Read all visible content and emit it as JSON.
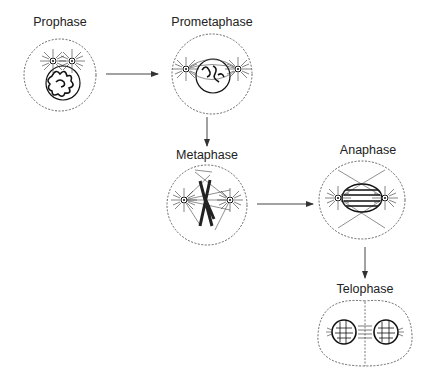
{
  "stages": [
    {
      "id": "prophase",
      "label": "Prophase"
    },
    {
      "id": "prometaphase",
      "label": "Prometaphase"
    },
    {
      "id": "metaphase",
      "label": "Metaphase"
    },
    {
      "id": "anaphase",
      "label": "Anaphase"
    },
    {
      "id": "telophase",
      "label": "Telophase"
    }
  ],
  "flow": [
    {
      "from": "prophase",
      "to": "prometaphase",
      "direction": "right"
    },
    {
      "from": "prometaphase",
      "to": "metaphase",
      "direction": "down"
    },
    {
      "from": "metaphase",
      "to": "anaphase",
      "direction": "right"
    },
    {
      "from": "anaphase",
      "to": "telophase",
      "direction": "down"
    }
  ],
  "colors": {
    "line": "#444444",
    "ink": "#111111",
    "background": "#ffffff"
  }
}
